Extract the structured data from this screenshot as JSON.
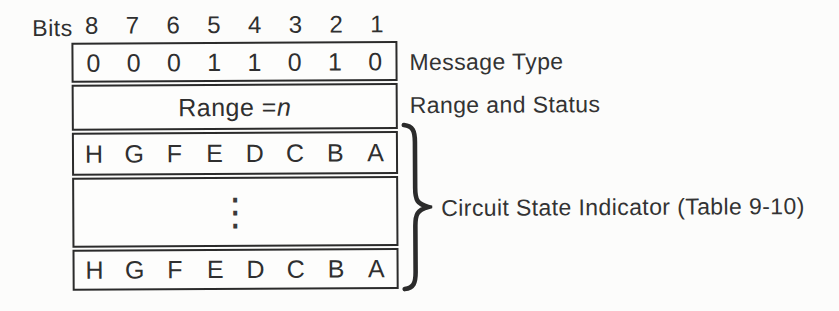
{
  "colors": {
    "ink": "#2b2b2b",
    "paper": "#fcfcfb"
  },
  "bits_header": {
    "label": "Bits",
    "numbers": [
      "8",
      "7",
      "6",
      "5",
      "4",
      "3",
      "2",
      "1"
    ]
  },
  "message_type_row": {
    "cells": [
      "0",
      "0",
      "0",
      "1",
      "1",
      "0",
      "1",
      "0"
    ],
    "caption": "Message Type"
  },
  "range_row": {
    "text": "Range = ",
    "variable": "n",
    "caption": "Range and Status"
  },
  "circuit_state": {
    "first_row_cells": [
      "H",
      "G",
      "F",
      "E",
      "D",
      "C",
      "B",
      "A"
    ],
    "ellipsis": "⋮",
    "last_row_cells": [
      "H",
      "G",
      "F",
      "E",
      "D",
      "C",
      "B",
      "A"
    ],
    "caption": "Circuit State Indicator (Table 9-10)"
  }
}
